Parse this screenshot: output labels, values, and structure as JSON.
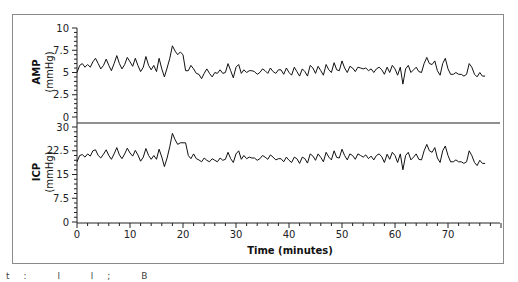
{
  "chart_data": [
    {
      "type": "line",
      "title": "",
      "panel": "top",
      "xlabel": "Time (minutes)",
      "ylabel": "AMP (mmHg)",
      "ylabel_line1": "AMP",
      "ylabel_line2": "(mmHg)",
      "ylim": [
        0,
        10
      ],
      "yticks": [
        "0",
        "2.5",
        "5",
        "7.5",
        "10"
      ],
      "xlim": [
        0,
        80
      ],
      "grid": false,
      "series": [
        {
          "name": "AMP",
          "color": "#111111",
          "x": [
            0,
            0.5,
            1,
            1.5,
            2,
            2.5,
            3,
            3.5,
            4,
            4.5,
            5,
            5.5,
            6,
            6.5,
            7,
            7.5,
            8,
            8.5,
            9,
            9.5,
            10,
            10.5,
            11,
            11.5,
            12,
            12.5,
            13,
            13.5,
            14,
            14.5,
            15,
            15.5,
            16,
            16.5,
            17,
            17.5,
            18,
            18.5,
            19,
            19.5,
            20,
            20.5,
            21,
            21.5,
            22,
            22.5,
            23,
            23.5,
            24,
            24.5,
            25,
            25.5,
            26,
            26.5,
            27,
            27.5,
            28,
            28.5,
            29,
            29.5,
            30,
            30.5,
            31,
            31.5,
            32,
            32.5,
            33,
            33.5,
            34,
            34.5,
            35,
            35.5,
            36,
            36.5,
            37,
            37.5,
            38,
            38.5,
            39,
            39.5,
            40,
            40.5,
            41,
            41.5,
            42,
            42.5,
            43,
            43.5,
            44,
            44.5,
            45,
            45.5,
            46,
            46.5,
            47,
            47.5,
            48,
            48.5,
            49,
            49.5,
            50,
            50.5,
            51,
            51.5,
            52,
            52.5,
            53,
            53.5,
            54,
            54.5,
            55,
            55.5,
            56,
            56.5,
            57,
            57.5,
            58,
            58.5,
            59,
            59.5,
            60,
            60.5,
            61,
            61.5,
            62,
            62.5,
            63,
            63.5,
            64,
            64.5,
            65,
            65.5,
            66,
            66.5,
            67,
            67.5,
            68,
            68.5,
            69,
            69.5,
            70,
            70.5,
            71,
            71.5,
            72,
            72.5,
            73,
            73.5,
            74,
            74.5,
            75,
            75.5,
            76,
            76.5,
            77,
            77.5,
            78,
            78.5,
            79
          ],
          "values": [
            5.0,
            5.8,
            6.0,
            5.6,
            5.9,
            5.6,
            6.2,
            6.6,
            6.0,
            5.4,
            5.8,
            6.5,
            5.8,
            5.2,
            6.0,
            6.9,
            6.0,
            5.4,
            5.9,
            6.7,
            6.2,
            5.7,
            6.6,
            5.8,
            5.1,
            5.6,
            6.8,
            5.8,
            5.3,
            5.8,
            5.1,
            6.6,
            5.4,
            4.5,
            5.5,
            6.6,
            8.0,
            7.4,
            7.0,
            7.3,
            7.0,
            5.2,
            5.2,
            5.8,
            5.4,
            4.9,
            4.8,
            4.3,
            4.9,
            5.4,
            4.9,
            4.5,
            5.0,
            4.9,
            5.3,
            4.9,
            5.0,
            6.0,
            5.2,
            4.4,
            5.6,
            5.9,
            4.9,
            5.3,
            5.0,
            5.2,
            5.2,
            5.1,
            4.8,
            5.0,
            5.4,
            5.2,
            4.9,
            5.5,
            5.1,
            4.9,
            5.3,
            5.3,
            4.8,
            5.5,
            5.0,
            4.7,
            5.6,
            5.1,
            4.6,
            5.4,
            5.1,
            4.6,
            5.8,
            5.5,
            4.9,
            5.7,
            5.2,
            4.7,
            5.9,
            5.3,
            5.0,
            6.1,
            5.3,
            5.2,
            6.3,
            5.5,
            5.0,
            5.7,
            5.5,
            5.1,
            5.6,
            5.5,
            5.4,
            5.5,
            5.2,
            5.4,
            5.0,
            5.4,
            5.6,
            5.3,
            4.8,
            5.6,
            5.0,
            5.8,
            5.4,
            4.7,
            5.6,
            3.7,
            5.4,
            5.8,
            5.0,
            5.3,
            5.6,
            5.1,
            5.0,
            6.0,
            6.7,
            6.0,
            5.9,
            6.3,
            5.2,
            4.7,
            6.0,
            6.6,
            5.4,
            4.8,
            4.8,
            5.0,
            4.8,
            4.8,
            4.6,
            4.8,
            6.0,
            5.6,
            4.8,
            4.5,
            5.0,
            4.6,
            4.6
          ]
        }
      ]
    },
    {
      "type": "line",
      "title": "",
      "panel": "bottom",
      "xlabel": "Time (minutes)",
      "ylabel": "ICP (mmHg)",
      "ylabel_line1": "ICP",
      "ylabel_line2": "(mmHg)",
      "ylim": [
        0,
        30
      ],
      "yticks": [
        "0",
        "7.5",
        "15",
        "22.5",
        "30"
      ],
      "xlim": [
        0,
        80
      ],
      "xticks": [
        "0",
        "10",
        "20",
        "30",
        "40",
        "50",
        "60",
        "70"
      ],
      "grid": false,
      "series": [
        {
          "name": "ICP",
          "color": "#111111",
          "x": [
            0,
            0.5,
            1,
            1.5,
            2,
            2.5,
            3,
            3.5,
            4,
            4.5,
            5,
            5.5,
            6,
            6.5,
            7,
            7.5,
            8,
            8.5,
            9,
            9.5,
            10,
            10.5,
            11,
            11.5,
            12,
            12.5,
            13,
            13.5,
            14,
            14.5,
            15,
            15.5,
            16,
            16.5,
            17,
            17.5,
            18,
            18.5,
            19,
            19.5,
            20,
            20.5,
            21,
            21.5,
            22,
            22.5,
            23,
            23.5,
            24,
            24.5,
            25,
            25.5,
            26,
            26.5,
            27,
            27.5,
            28,
            28.5,
            29,
            29.5,
            30,
            30.5,
            31,
            31.5,
            32,
            32.5,
            33,
            33.5,
            34,
            34.5,
            35,
            35.5,
            36,
            36.5,
            37,
            37.5,
            38,
            38.5,
            39,
            39.5,
            40,
            40.5,
            41,
            41.5,
            42,
            42.5,
            43,
            43.5,
            44,
            44.5,
            45,
            45.5,
            46,
            46.5,
            47,
            47.5,
            48,
            48.5,
            49,
            49.5,
            50,
            50.5,
            51,
            51.5,
            52,
            52.5,
            53,
            53.5,
            54,
            54.5,
            55,
            55.5,
            56,
            56.5,
            57,
            57.5,
            58,
            58.5,
            59,
            59.5,
            60,
            60.5,
            61,
            61.5,
            62,
            62.5,
            63,
            63.5,
            64,
            64.5,
            65,
            65.5,
            66,
            66.5,
            67,
            67.5,
            68,
            68.5,
            69,
            69.5,
            70,
            70.5,
            71,
            71.5,
            72,
            72.5,
            73,
            73.5,
            74,
            74.5,
            75,
            75.5,
            76,
            76.5,
            77,
            77.5,
            78,
            78.5,
            79
          ],
          "values": [
            19.0,
            21.0,
            21.3,
            20.5,
            21.5,
            20.8,
            22.5,
            22.8,
            21.0,
            20.2,
            21.4,
            22.8,
            21.0,
            19.8,
            21.5,
            23.5,
            21.2,
            20.0,
            21.5,
            23.3,
            21.8,
            20.8,
            22.6,
            21.2,
            19.2,
            20.5,
            23.2,
            21.0,
            19.8,
            21.0,
            19.8,
            23.0,
            20.5,
            17.5,
            20.2,
            23.8,
            28.0,
            26.0,
            24.5,
            25.0,
            25.0,
            25.0,
            21.0,
            20.0,
            21.5,
            20.0,
            19.6,
            19.0,
            20.2,
            19.5,
            19.0,
            20.0,
            19.5,
            19.0,
            20.2,
            19.5,
            19.8,
            22.0,
            20.0,
            18.8,
            21.5,
            22.5,
            19.8,
            21.0,
            20.0,
            20.5,
            20.2,
            20.2,
            19.5,
            20.0,
            21.0,
            20.5,
            19.8,
            21.2,
            20.5,
            19.6,
            20.0,
            20.0,
            19.0,
            20.5,
            19.5,
            18.8,
            20.5,
            20.0,
            18.5,
            20.5,
            20.0,
            18.6,
            21.5,
            20.8,
            19.5,
            21.5,
            20.4,
            19.0,
            22.0,
            20.5,
            19.6,
            22.5,
            20.4,
            20.2,
            23.0,
            21.0,
            19.6,
            21.5,
            21.0,
            19.8,
            21.5,
            21.0,
            20.5,
            21.2,
            20.0,
            20.8,
            19.6,
            21.0,
            21.5,
            20.6,
            18.8,
            21.4,
            19.8,
            22.0,
            21.0,
            18.8,
            21.5,
            16.5,
            21.0,
            22.0,
            19.6,
            20.5,
            21.5,
            19.8,
            19.6,
            22.5,
            24.5,
            22.5,
            22.0,
            23.5,
            20.2,
            18.8,
            22.5,
            24.0,
            21.0,
            19.0,
            19.0,
            19.6,
            19.0,
            19.0,
            18.5,
            19.0,
            22.5,
            21.0,
            18.8,
            17.8,
            19.5,
            18.5,
            18.5
          ]
        }
      ]
    }
  ],
  "caption": "t: l l; B"
}
